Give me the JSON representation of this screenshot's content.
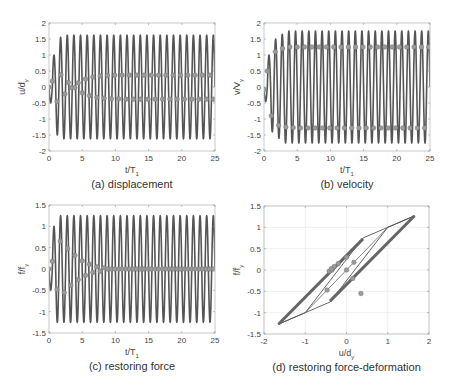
{
  "chart_data": [
    {
      "id": "a",
      "type": "line",
      "caption": "(a) displacement",
      "xlabel": "t/T",
      "xlabel_sub": "1",
      "ylabel": "u/d",
      "ylabel_sub": "y",
      "xlim": [
        0,
        25
      ],
      "ylim": [
        -2,
        2
      ],
      "xticks": [
        0,
        5,
        10,
        15,
        20,
        25
      ],
      "yticks": [
        -2,
        -1.5,
        -1,
        -0.5,
        0,
        0.5,
        1,
        1.5,
        2
      ],
      "ytick_labels": [
        "-2",
        "-1.5",
        "-1",
        "-0.5",
        "0",
        "0.5",
        "1",
        "1.5",
        "2"
      ],
      "grid": false,
      "box": {
        "x0": 49,
        "x1": 215,
        "y0": 23,
        "y1": 151
      },
      "series": [
        {
          "name": "response",
          "kind": "oscillation",
          "period": 1.0,
          "amplitude_steady": 1.62,
          "initial_peaks": [
            -0.5,
            1.0,
            -1.5,
            1.55
          ],
          "color": "#555555"
        },
        {
          "name": "upper markers",
          "kind": "markers",
          "points": [
            [
              0,
              0
            ],
            [
              0.5,
              0.18
            ],
            [
              1.2,
              -0.45
            ],
            [
              1.8,
              0.38
            ],
            [
              2.4,
              -0.22
            ],
            [
              2.9,
              0.14
            ],
            [
              3.4,
              -0.02
            ],
            [
              3.9,
              -0.02
            ],
            [
              4.4,
              0.13
            ],
            [
              5.0,
              -0.18
            ],
            [
              5.5,
              0.25
            ],
            [
              6.1,
              -0.27
            ],
            [
              6.6,
              0.31
            ],
            [
              7.2,
              -0.33
            ],
            [
              7.7,
              0.35
            ],
            [
              8.3,
              -0.35
            ],
            [
              8.8,
              0.36
            ],
            [
              9.4,
              -0.37
            ],
            [
              9.9,
              0.37
            ],
            [
              10.5,
              -0.37
            ],
            [
              11.0,
              0.37
            ],
            [
              11.6,
              -0.38
            ],
            [
              12.1,
              0.37
            ],
            [
              12.7,
              -0.38
            ],
            [
              13.2,
              0.37
            ],
            [
              13.8,
              -0.38
            ],
            [
              14.3,
              0.37
            ],
            [
              14.9,
              -0.38
            ],
            [
              15.4,
              0.37
            ],
            [
              16.0,
              -0.38
            ],
            [
              16.5,
              0.37
            ],
            [
              17.1,
              -0.38
            ],
            [
              17.6,
              0.37
            ],
            [
              18.2,
              -0.38
            ],
            [
              18.7,
              0.37
            ],
            [
              19.3,
              -0.38
            ],
            [
              19.8,
              0.37
            ],
            [
              20.4,
              -0.38
            ],
            [
              20.9,
              0.37
            ],
            [
              21.5,
              -0.38
            ],
            [
              22.0,
              0.37
            ],
            [
              22.6,
              -0.38
            ],
            [
              23.1,
              0.37
            ],
            [
              23.7,
              -0.38
            ],
            [
              24.2,
              0.37
            ],
            [
              24.8,
              -0.38
            ]
          ],
          "color": "#888888"
        }
      ]
    },
    {
      "id": "b",
      "type": "line",
      "caption": "(b) velocity",
      "xlabel": "t/T",
      "xlabel_sub": "1",
      "ylabel": "v/V",
      "ylabel_sub": "y",
      "xlim": [
        0,
        25
      ],
      "ylim": [
        -2,
        2
      ],
      "xticks": [
        0,
        5,
        10,
        15,
        20,
        25
      ],
      "yticks": [
        -2,
        -1.5,
        -1,
        -0.5,
        0,
        0.5,
        1,
        1.5,
        2
      ],
      "ytick_labels": [
        "-2",
        "-1.5",
        "-1",
        "-0.5",
        "0",
        "0.5",
        "1",
        "1.5",
        "2"
      ],
      "grid": false,
      "box": {
        "x0": 264,
        "x1": 430,
        "y0": 23,
        "y1": 151
      },
      "series": [
        {
          "name": "response",
          "kind": "oscillation",
          "period": 1.0,
          "amplitude_steady": 1.75,
          "initial_peaks": [
            -0.45,
            1.0,
            -1.4,
            1.5,
            -1.6,
            1.65
          ],
          "color": "#555555"
        },
        {
          "name": "markers",
          "kind": "markers",
          "points": [
            [
              0,
              -0.08
            ],
            [
              0.5,
              0.5
            ],
            [
              1.1,
              -0.9
            ],
            [
              1.7,
              1.1
            ],
            [
              2.2,
              -1.2
            ],
            [
              2.8,
              1.2
            ],
            [
              3.3,
              -1.25
            ],
            [
              3.9,
              1.25
            ],
            [
              4.4,
              -1.27
            ],
            [
              5.0,
              1.25
            ],
            [
              5.5,
              -1.28
            ],
            [
              6.1,
              1.25
            ],
            [
              6.6,
              -1.28
            ],
            [
              7.2,
              1.25
            ],
            [
              7.7,
              -1.28
            ],
            [
              8.3,
              1.25
            ],
            [
              8.8,
              -1.28
            ],
            [
              9.4,
              1.25
            ],
            [
              9.9,
              -1.28
            ],
            [
              10.5,
              1.25
            ],
            [
              11.0,
              -1.28
            ],
            [
              11.6,
              1.25
            ],
            [
              12.1,
              -1.28
            ],
            [
              12.7,
              1.25
            ],
            [
              13.2,
              -1.28
            ],
            [
              13.8,
              1.25
            ],
            [
              14.3,
              -1.28
            ],
            [
              14.9,
              1.25
            ],
            [
              15.4,
              -1.28
            ],
            [
              16.0,
              1.25
            ],
            [
              16.5,
              -1.28
            ],
            [
              17.1,
              1.25
            ],
            [
              17.6,
              -1.28
            ],
            [
              18.2,
              1.25
            ],
            [
              18.7,
              -1.28
            ],
            [
              19.3,
              1.25
            ],
            [
              19.8,
              -1.28
            ],
            [
              20.4,
              1.25
            ],
            [
              20.9,
              -1.28
            ],
            [
              21.5,
              1.25
            ],
            [
              22.0,
              -1.28
            ],
            [
              22.6,
              1.25
            ],
            [
              23.1,
              -1.28
            ],
            [
              23.7,
              1.25
            ],
            [
              24.2,
              -1.28
            ],
            [
              24.8,
              1.25
            ]
          ],
          "color": "#888888"
        }
      ]
    },
    {
      "id": "c",
      "type": "line",
      "caption": "(c) restoring force",
      "xlabel": "t/T",
      "xlabel_sub": "1",
      "ylabel": "f/f",
      "ylabel_sub": "y",
      "xlim": [
        0,
        25
      ],
      "ylim": [
        -1.5,
        1.5
      ],
      "xticks": [
        0,
        5,
        10,
        15,
        20,
        25
      ],
      "yticks": [
        -1.5,
        -1,
        -0.5,
        0,
        0.5,
        1,
        1.5
      ],
      "ytick_labels": [
        "-1.5",
        "-1",
        "-0.5",
        "0",
        "0.5",
        "1",
        "1.5"
      ],
      "grid": false,
      "box": {
        "x0": 49,
        "x1": 215,
        "y0": 205,
        "y1": 333
      },
      "series": [
        {
          "name": "response",
          "kind": "oscillation",
          "period": 1.0,
          "amplitude_steady": 1.25,
          "initial_peaks": [
            -0.5,
            1.0,
            -1.25,
            1.25
          ],
          "color": "#555555"
        },
        {
          "name": "markers",
          "kind": "markers",
          "points": [
            [
              0,
              0
            ],
            [
              0.5,
              0.18
            ],
            [
              1.2,
              -0.48
            ],
            [
              1.7,
              0.65
            ],
            [
              2.3,
              -0.55
            ],
            [
              2.8,
              0.48
            ],
            [
              3.3,
              -0.38
            ],
            [
              3.9,
              0.32
            ],
            [
              4.4,
              -0.25
            ],
            [
              5.0,
              0.19
            ],
            [
              5.5,
              -0.15
            ],
            [
              6.1,
              0.11
            ],
            [
              6.6,
              -0.08
            ],
            [
              7.2,
              0.05
            ],
            [
              7.7,
              -0.05
            ],
            [
              8.3,
              0.03
            ],
            [
              8.8,
              0.0
            ],
            [
              9.4,
              0.0
            ],
            [
              9.9,
              0.0
            ],
            [
              10.5,
              0.0
            ],
            [
              11.0,
              0.0
            ],
            [
              11.6,
              0.0
            ],
            [
              12.1,
              0.0
            ],
            [
              12.7,
              0.0
            ],
            [
              13.2,
              0.0
            ],
            [
              13.8,
              0.0
            ],
            [
              14.3,
              0.0
            ],
            [
              14.9,
              0.0
            ],
            [
              15.4,
              0.0
            ],
            [
              16.0,
              0.0
            ],
            [
              16.5,
              0.0
            ],
            [
              17.1,
              0.0
            ],
            [
              17.6,
              0.0
            ],
            [
              18.2,
              0.0
            ],
            [
              18.7,
              0.0
            ],
            [
              19.3,
              0.0
            ],
            [
              19.8,
              0.0
            ],
            [
              20.4,
              0.0
            ],
            [
              20.9,
              0.0
            ],
            [
              21.5,
              0.0
            ],
            [
              22.0,
              0.0
            ],
            [
              22.6,
              0.0
            ],
            [
              23.1,
              0.0
            ],
            [
              23.7,
              0.0
            ],
            [
              24.2,
              0.0
            ],
            [
              24.8,
              0.0
            ]
          ],
          "color": "#888888"
        }
      ]
    },
    {
      "id": "d",
      "type": "line",
      "caption": "(d) restoring force-deformation",
      "xlabel": "u/d",
      "xlabel_sub": "y",
      "ylabel": "f/f",
      "ylabel_sub": "y",
      "xlim": [
        -2,
        2
      ],
      "ylim": [
        -1.5,
        1.5
      ],
      "xticks": [
        -2,
        -1,
        0,
        1,
        2
      ],
      "xtick_labels": [
        "-2",
        "-1",
        "0",
        "1",
        "2"
      ],
      "yticks": [
        -1.5,
        -1,
        -0.5,
        0,
        0.5,
        1,
        1.5
      ],
      "ytick_labels": [
        "-1.5",
        "-1",
        "-0.5",
        "0",
        "0.5",
        "1",
        "1.5"
      ],
      "grid": true,
      "box": {
        "x0": 264,
        "x1": 429,
        "y0": 206,
        "y1": 334
      },
      "series": [
        {
          "name": "hysteresis outer",
          "kind": "polyline",
          "points": [
            [
              -1.65,
              -1.27
            ],
            [
              -0.4,
              -0.75
            ],
            [
              1.0,
              1.0
            ],
            [
              1.65,
              1.27
            ],
            [
              0.4,
              0.75
            ],
            [
              -1.0,
              -1.0
            ],
            [
              -1.65,
              -1.27
            ]
          ],
          "color": "#555555",
          "width": 0.9
        },
        {
          "name": "upper branch (steady)",
          "kind": "polyline",
          "points": [
            [
              -1.65,
              -1.27
            ],
            [
              0.4,
              0.73
            ]
          ],
          "color": "#666666",
          "width": 3.0
        },
        {
          "name": "lower branch (steady)",
          "kind": "polyline",
          "points": [
            [
              -0.4,
              -0.73
            ],
            [
              1.65,
              1.27
            ]
          ],
          "color": "#666666",
          "width": 3.0
        },
        {
          "name": "initial path",
          "kind": "polyline",
          "points": [
            [
              -1.0,
              -1.0
            ],
            [
              0.0,
              0.0
            ],
            [
              1.0,
              1.0
            ]
          ],
          "color": "#666666",
          "width": 0.8
        },
        {
          "name": "markers",
          "kind": "markers",
          "points": [
            [
              0,
              0
            ],
            [
              0.18,
              0.18
            ],
            [
              -0.47,
              -0.47
            ],
            [
              -0.42,
              -0.03
            ],
            [
              -0.3,
              0.08
            ],
            [
              -0.2,
              0.15
            ],
            [
              0.0,
              0.3
            ],
            [
              0.35,
              -0.55
            ],
            [
              0.15,
              -0.2
            ],
            [
              -0.35,
              0.0
            ],
            [
              -0.37,
              0.03
            ]
          ],
          "color": "#888888"
        }
      ]
    }
  ]
}
